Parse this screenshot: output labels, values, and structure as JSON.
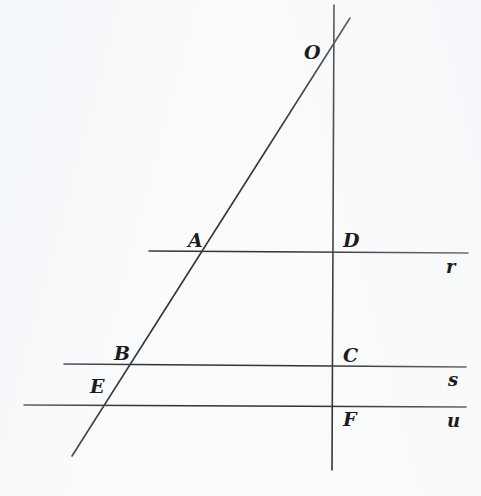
{
  "figure": {
    "background_color": "#fafbfc",
    "stroke_color": "#35353b",
    "stroke_width": 1.6,
    "width": 481,
    "height": 496,
    "lines": [
      {
        "name": "line-r",
        "label": "r",
        "kind": "horizontal",
        "x1": 149,
        "y1": 251,
        "x2": 468,
        "y2": 253,
        "label_x": 446,
        "label_y": 258
      },
      {
        "name": "line-s",
        "label": "s",
        "kind": "horizontal",
        "x1": 64,
        "y1": 364,
        "x2": 466,
        "y2": 367,
        "label_x": 448,
        "label_y": 371
      },
      {
        "name": "line-u",
        "label": "u",
        "kind": "horizontal",
        "x1": 24,
        "y1": 405,
        "x2": 466,
        "y2": 407,
        "label_x": 447,
        "label_y": 412
      },
      {
        "name": "vertical-transversal",
        "label": "",
        "kind": "vertical",
        "x1": 334,
        "y1": 5,
        "x2": 332,
        "y2": 470,
        "label_x": null,
        "label_y": null
      },
      {
        "name": "oblique-transversal",
        "label": "",
        "kind": "oblique",
        "x1": 350,
        "y1": 18,
        "x2": 72,
        "y2": 456,
        "label_x": null,
        "label_y": null
      }
    ],
    "points": [
      {
        "name": "point-O",
        "label": "O",
        "x": 333,
        "y": 53,
        "label_x": 304,
        "label_y": 43
      },
      {
        "name": "point-A",
        "label": "A",
        "x": 207,
        "y": 251,
        "label_x": 188,
        "label_y": 231
      },
      {
        "name": "point-D",
        "label": "D",
        "x": 333,
        "y": 252,
        "label_x": 343,
        "label_y": 231
      },
      {
        "name": "point-B",
        "label": "B",
        "x": 133,
        "y": 365,
        "label_x": 114,
        "label_y": 344
      },
      {
        "name": "point-C",
        "label": "C",
        "x": 333,
        "y": 366,
        "label_x": 343,
        "label_y": 346
      },
      {
        "name": "point-E",
        "label": "E",
        "x": 107,
        "y": 405,
        "label_x": 90,
        "label_y": 377
      },
      {
        "name": "point-F",
        "label": "F",
        "x": 333,
        "y": 406,
        "label_x": 343,
        "label_y": 410
      }
    ]
  }
}
